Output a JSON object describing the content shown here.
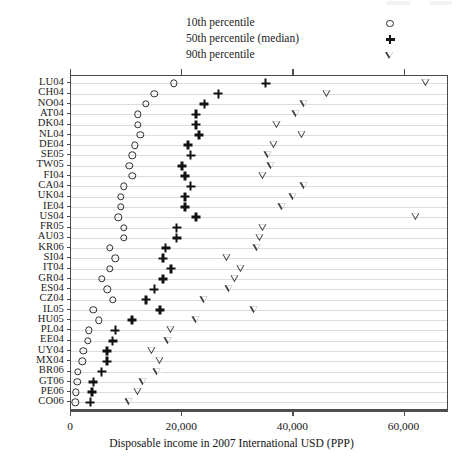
{
  "figure": {
    "x_axis_title": "Disposable income in 2007 International USD (PPP)",
    "x_ticks": [
      "0",
      "20,000",
      "40,000",
      "60,000"
    ]
  },
  "legend": {
    "items": [
      {
        "label": "10th percentile",
        "marker": "circle-icon"
      },
      {
        "label": "50th percentile (median)",
        "marker": "plus-icon"
      },
      {
        "label": "90th percentile",
        "marker": "triangle-down-icon"
      }
    ]
  },
  "chart_data": {
    "type": "scatter",
    "title": "",
    "subtitle": "",
    "xlabel": "Disposable income in 2007 International USD (PPP)",
    "ylabel": "",
    "xlim": [
      0,
      68000
    ],
    "xticks": [
      0,
      20000,
      40000,
      60000
    ],
    "xtick_labels": [
      "0",
      "20,000",
      "40,000",
      "60,000"
    ],
    "grid": true,
    "grid_axis": "y",
    "legend_position": "top-center",
    "orientation": "horizontal",
    "categories": [
      "LU04",
      "CH04",
      "NO04",
      "AT04",
      "DK04",
      "NL04",
      "DE04",
      "SE05",
      "TW05",
      "FI04",
      "CA04",
      "UK04",
      "IE04",
      "US04",
      "FR05",
      "AU03",
      "KR06",
      "SI04",
      "IT04",
      "GR04",
      "ES04",
      "CZ04",
      "IL05",
      "HU05",
      "PL04",
      "EE04",
      "UY04",
      "MX04",
      "BR06",
      "GT06",
      "PE06",
      "CO06"
    ],
    "series": [
      {
        "name": "10th percentile",
        "marker": "circle",
        "values": [
          18500,
          15000,
          13500,
          12000,
          12000,
          12500,
          11500,
          11000,
          10500,
          11000,
          9500,
          9000,
          9000,
          8500,
          9500,
          9500,
          7000,
          8000,
          7000,
          5500,
          6500,
          7500,
          4000,
          5000,
          3200,
          3000,
          2200,
          2000,
          1200,
          1100,
          900,
          800
        ]
      },
      {
        "name": "50th percentile (median)",
        "marker": "plus",
        "values": [
          35000,
          26500,
          24000,
          22500,
          22500,
          23000,
          21000,
          21500,
          20000,
          20500,
          21500,
          20500,
          20500,
          22500,
          19000,
          19000,
          17000,
          16500,
          18000,
          16500,
          15000,
          13500,
          16000,
          11000,
          8000,
          7500,
          6500,
          6500,
          5500,
          4000,
          3800,
          3500
        ]
      },
      {
        "name": "90th percentile",
        "marker": "triangle-down",
        "values": [
          63800,
          46000,
          42000,
          40500,
          37000,
          41500,
          36500,
          35500,
          36000,
          34500,
          42000,
          40000,
          38000,
          62000,
          34500,
          34000,
          33500,
          28000,
          30500,
          29500,
          28500,
          24000,
          33000,
          22500,
          18000,
          17500,
          14500,
          16000,
          15500,
          13000,
          12000,
          10500
        ]
      }
    ]
  }
}
